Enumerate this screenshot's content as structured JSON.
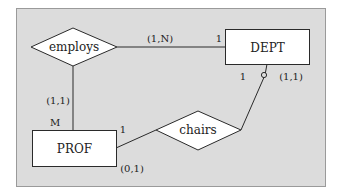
{
  "diagram": {
    "type": "entity-relationship",
    "colors": {
      "panel_fill": "#dcdcdc",
      "panel_border": "#9a9a9a",
      "shape_fill": "#ffffff",
      "stroke": "#2a2a2a",
      "text": "#222222"
    },
    "entities": [
      {
        "id": "dept",
        "label": "DEPT"
      },
      {
        "id": "prof",
        "label": "PROF"
      }
    ],
    "relationships": [
      {
        "id": "employs",
        "label": "employs"
      },
      {
        "id": "chairs",
        "label": "chairs"
      }
    ],
    "connections": [
      {
        "from": "employs",
        "to": "dept",
        "cardinality": "1",
        "participation": "(1,N)"
      },
      {
        "from": "employs",
        "to": "prof",
        "cardinality": "M",
        "participation": "(1,1)"
      },
      {
        "from": "chairs",
        "to": "dept",
        "cardinality": "1",
        "participation": "(1,1)",
        "marker": "open-circle"
      },
      {
        "from": "chairs",
        "to": "prof",
        "cardinality": "1",
        "participation": "(0,1)"
      }
    ]
  }
}
